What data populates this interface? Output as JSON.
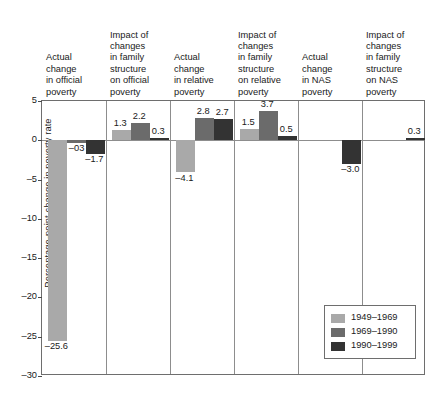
{
  "chart_data": {
    "type": "bar",
    "title": "",
    "xlabel": "",
    "ylabel": "Percentage-point change in poverty rate",
    "ylim": [
      -30,
      5
    ],
    "yticks": [
      "5",
      "0",
      "–5",
      "–10",
      "–15",
      "–20",
      "–25",
      "–30"
    ],
    "ytick_values": [
      5,
      0,
      -5,
      -10,
      -15,
      -20,
      -25,
      -30
    ],
    "grid": false,
    "legend_position": "lower-right",
    "categories": [
      "Actual change in official poverty",
      "Impact of changes in family structure on official poverty",
      "Actual change in relative poverty",
      "Impact of changes in family structure on relative poverty",
      "Actual change in NAS poverty",
      "Impact of changes in family structure on NAS poverty"
    ],
    "series": [
      {
        "name": "1949–1969",
        "color": "#a9a9a9",
        "values": [
          -25.6,
          1.3,
          -4.1,
          1.5,
          null,
          null
        ],
        "labels": [
          "–25.6",
          "1.3",
          "–4.1",
          "1.5",
          "",
          ""
        ]
      },
      {
        "name": "1969–1990",
        "color": "#6b6b6b",
        "values": [
          -0.3,
          2.2,
          2.8,
          3.7,
          null,
          null
        ],
        "labels": [
          "–03",
          "2.2",
          "2.8",
          "3.7",
          "",
          ""
        ]
      },
      {
        "name": "1990–1999",
        "color": "#333333",
        "values": [
          -1.7,
          0.3,
          2.7,
          0.5,
          -3.0,
          0.3
        ],
        "labels": [
          "–1.7",
          "0.3",
          "2.7",
          "0.5",
          "–3.0",
          "0.3"
        ]
      }
    ]
  },
  "headers": [
    "Actual\nchange\nin official\npoverty",
    "Impact of\nchanges\nin family\nstructure\non official\npoverty",
    "Actual\nchange\nin relative\npoverty",
    "Impact of\nchanges\nin family\nstructure\non relative\npoverty",
    "Actual\nchange\nin NAS\npoverty",
    "Impact of\nchanges\nin family\nstructure\non NAS\npoverty"
  ],
  "legend": {
    "entries": [
      {
        "label": "1949–1969",
        "color": "#a9a9a9"
      },
      {
        "label": "1969–1990",
        "color": "#6b6b6b"
      },
      {
        "label": "1990–1999",
        "color": "#333333"
      }
    ]
  }
}
